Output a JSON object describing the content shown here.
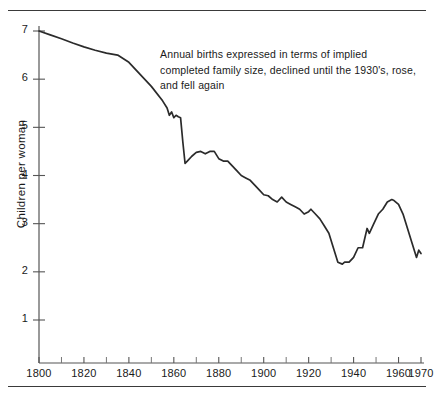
{
  "chart_data": {
    "type": "line",
    "title": "",
    "subtitle": "",
    "xlabel": "",
    "ylabel": "Children per woman",
    "xlim": [
      1800,
      1970
    ],
    "ylim": [
      0,
      7.4
    ],
    "grid": false,
    "legend": null,
    "annotations": [
      {
        "text": "Annual births expressed in terms of implied completed family size, declined until the 1930's, rose, and fell again",
        "x": 1853,
        "y": 6.55
      }
    ],
    "xticks_major": [
      1800,
      1820,
      1840,
      1860,
      1880,
      1900,
      1920,
      1940,
      1960,
      1970
    ],
    "xtick_labels": [
      "1800",
      "1820",
      "1840",
      "1860",
      "1880",
      "1900",
      "1920",
      "1940",
      "1960",
      "1970"
    ],
    "xticks_minor": [
      1810,
      1830,
      1850,
      1870,
      1890,
      1910,
      1930,
      1950
    ],
    "yticks": [
      1,
      2,
      3,
      4,
      5,
      6,
      7
    ],
    "ytick_labels": [
      "1",
      "2",
      "3",
      "4",
      "5",
      "6",
      "7"
    ],
    "line_color": "#2b2b2b",
    "axis_color": "#555555",
    "background_color": "#ffffff",
    "series": [
      {
        "name": "Implied completed family size",
        "x": [
          1800,
          1805,
          1810,
          1815,
          1820,
          1825,
          1830,
          1835,
          1840,
          1845,
          1850,
          1855,
          1857,
          1858,
          1859,
          1860,
          1861,
          1862,
          1863,
          1864,
          1865,
          1866,
          1868,
          1870,
          1872,
          1874,
          1876,
          1878,
          1880,
          1882,
          1884,
          1886,
          1888,
          1890,
          1892,
          1894,
          1896,
          1898,
          1900,
          1902,
          1904,
          1906,
          1908,
          1910,
          1912,
          1914,
          1916,
          1918,
          1920,
          1921,
          1923,
          1925,
          1927,
          1929,
          1931,
          1933,
          1935,
          1936,
          1938,
          1940,
          1942,
          1944,
          1946,
          1947,
          1949,
          1951,
          1953,
          1955,
          1957,
          1958,
          1960,
          1962,
          1964,
          1966,
          1968,
          1969,
          1970
        ],
        "values": [
          7.0,
          6.92,
          6.84,
          6.75,
          6.67,
          6.6,
          6.54,
          6.5,
          6.35,
          6.1,
          5.85,
          5.55,
          5.4,
          5.25,
          5.32,
          5.2,
          5.25,
          5.22,
          5.2,
          4.7,
          4.25,
          4.3,
          4.4,
          4.48,
          4.5,
          4.45,
          4.5,
          4.5,
          4.35,
          4.3,
          4.3,
          4.2,
          4.1,
          4.0,
          3.95,
          3.9,
          3.8,
          3.7,
          3.6,
          3.58,
          3.5,
          3.45,
          3.55,
          3.45,
          3.4,
          3.35,
          3.3,
          3.2,
          3.25,
          3.3,
          3.2,
          3.1,
          2.95,
          2.8,
          2.5,
          2.2,
          2.16,
          2.2,
          2.2,
          2.3,
          2.5,
          2.5,
          2.9,
          2.8,
          3.0,
          3.2,
          3.3,
          3.45,
          3.5,
          3.48,
          3.4,
          3.2,
          2.9,
          2.6,
          2.3,
          2.45,
          2.38
        ]
      }
    ]
  },
  "figure": {
    "rule_top_name": "top-horizontal-rule",
    "rule_bottom_name": "bottom-horizontal-rule"
  }
}
